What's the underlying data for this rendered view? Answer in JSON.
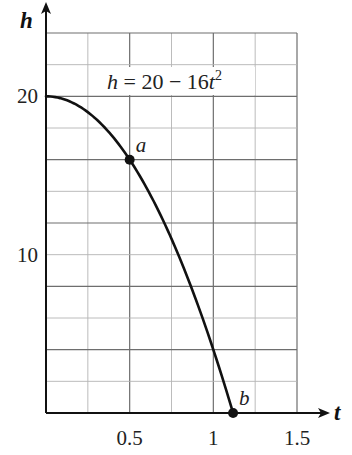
{
  "chart_data": {
    "type": "line",
    "title": "",
    "equation_label": "h = 20 − 16t²",
    "equation_parts": {
      "lhs": "h",
      "eq": " = 20 − 16",
      "var": "t",
      "exp": "2"
    },
    "xlabel": "t",
    "ylabel": "h",
    "xlim": [
      0,
      1.5
    ],
    "ylim": [
      0,
      24
    ],
    "x_ticks": [
      {
        "value": 0.5,
        "label": "0.5"
      },
      {
        "value": 1,
        "label": "1"
      },
      {
        "value": 1.5,
        "label": "1.5"
      }
    ],
    "y_ticks": [
      {
        "value": 10,
        "label": "10"
      },
      {
        "value": 20,
        "label": "20"
      }
    ],
    "grid": {
      "on": true,
      "x_step": 0.25,
      "y_step": 2,
      "major_x_step": 0.5,
      "major_y_step": 4
    },
    "series": [
      {
        "name": "h = 20 - 16t^2",
        "x": [
          0,
          0.1,
          0.2,
          0.3,
          0.4,
          0.5,
          0.6,
          0.7,
          0.8,
          0.9,
          1.0,
          1.118
        ],
        "values": [
          20,
          19.84,
          19.36,
          18.56,
          17.44,
          16,
          14.24,
          12.16,
          9.76,
          7.04,
          4,
          0
        ]
      }
    ],
    "annotations": [
      {
        "label": "a",
        "t": 0.5,
        "h": 16
      },
      {
        "label": "b",
        "t": 1.118,
        "h": 0
      }
    ],
    "legend": "none"
  }
}
